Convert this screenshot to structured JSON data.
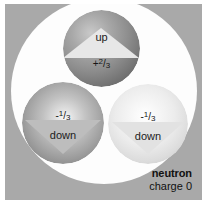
{
  "figure": {
    "background_color": "#a9a9a9",
    "nucleon_color": "#fdfdfd"
  },
  "quarks": [
    {
      "id": "up",
      "label": "up",
      "charge_sign": "+",
      "charge_numerator": "2",
      "charge_slash": "/",
      "charge_denominator": "3",
      "arrow": "up-triangle",
      "sphere_color": "#8d8d8d"
    },
    {
      "id": "down-left",
      "label": "down",
      "charge_sign": "-",
      "charge_numerator": "1",
      "charge_slash": "/",
      "charge_denominator": "3",
      "arrow": "down-triangle",
      "sphere_color": "#c2c2c2"
    },
    {
      "id": "down-right",
      "label": "down",
      "charge_sign": "-",
      "charge_numerator": "1",
      "charge_slash": "/",
      "charge_denominator": "3",
      "arrow": "down-triangle",
      "sphere_color": "#ececec"
    }
  ],
  "caption": {
    "particle_name": "neutron",
    "particle_charge": "charge 0"
  }
}
